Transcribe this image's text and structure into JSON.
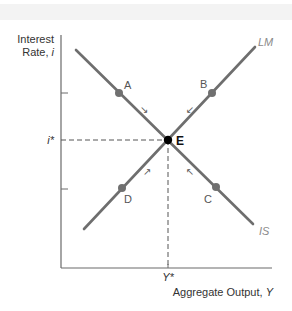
{
  "diagram": {
    "type": "IS-LM equilibrium",
    "y_axis_label_line1": "Interest",
    "y_axis_label_line2_text": "Rate, ",
    "y_axis_label_line2_var": "i",
    "x_axis_label_text": "Aggregate Output, ",
    "x_axis_label_var": "Y",
    "curves": {
      "lm_label": "LM",
      "is_label": "IS"
    },
    "equilibrium": {
      "label": "E",
      "rate_label": "i*",
      "output_label": "Y*"
    },
    "points": {
      "a": "A",
      "b": "B",
      "c": "C",
      "d": "D"
    },
    "arrows": {
      "from_a": "↘",
      "from_b": "↙",
      "from_c": "↖",
      "from_d": "↗"
    },
    "colors": {
      "curve": "#6e6e6e",
      "point": "#707070",
      "equilibrium": "#000000",
      "axis": "#555555",
      "dashed": "#555555"
    }
  }
}
